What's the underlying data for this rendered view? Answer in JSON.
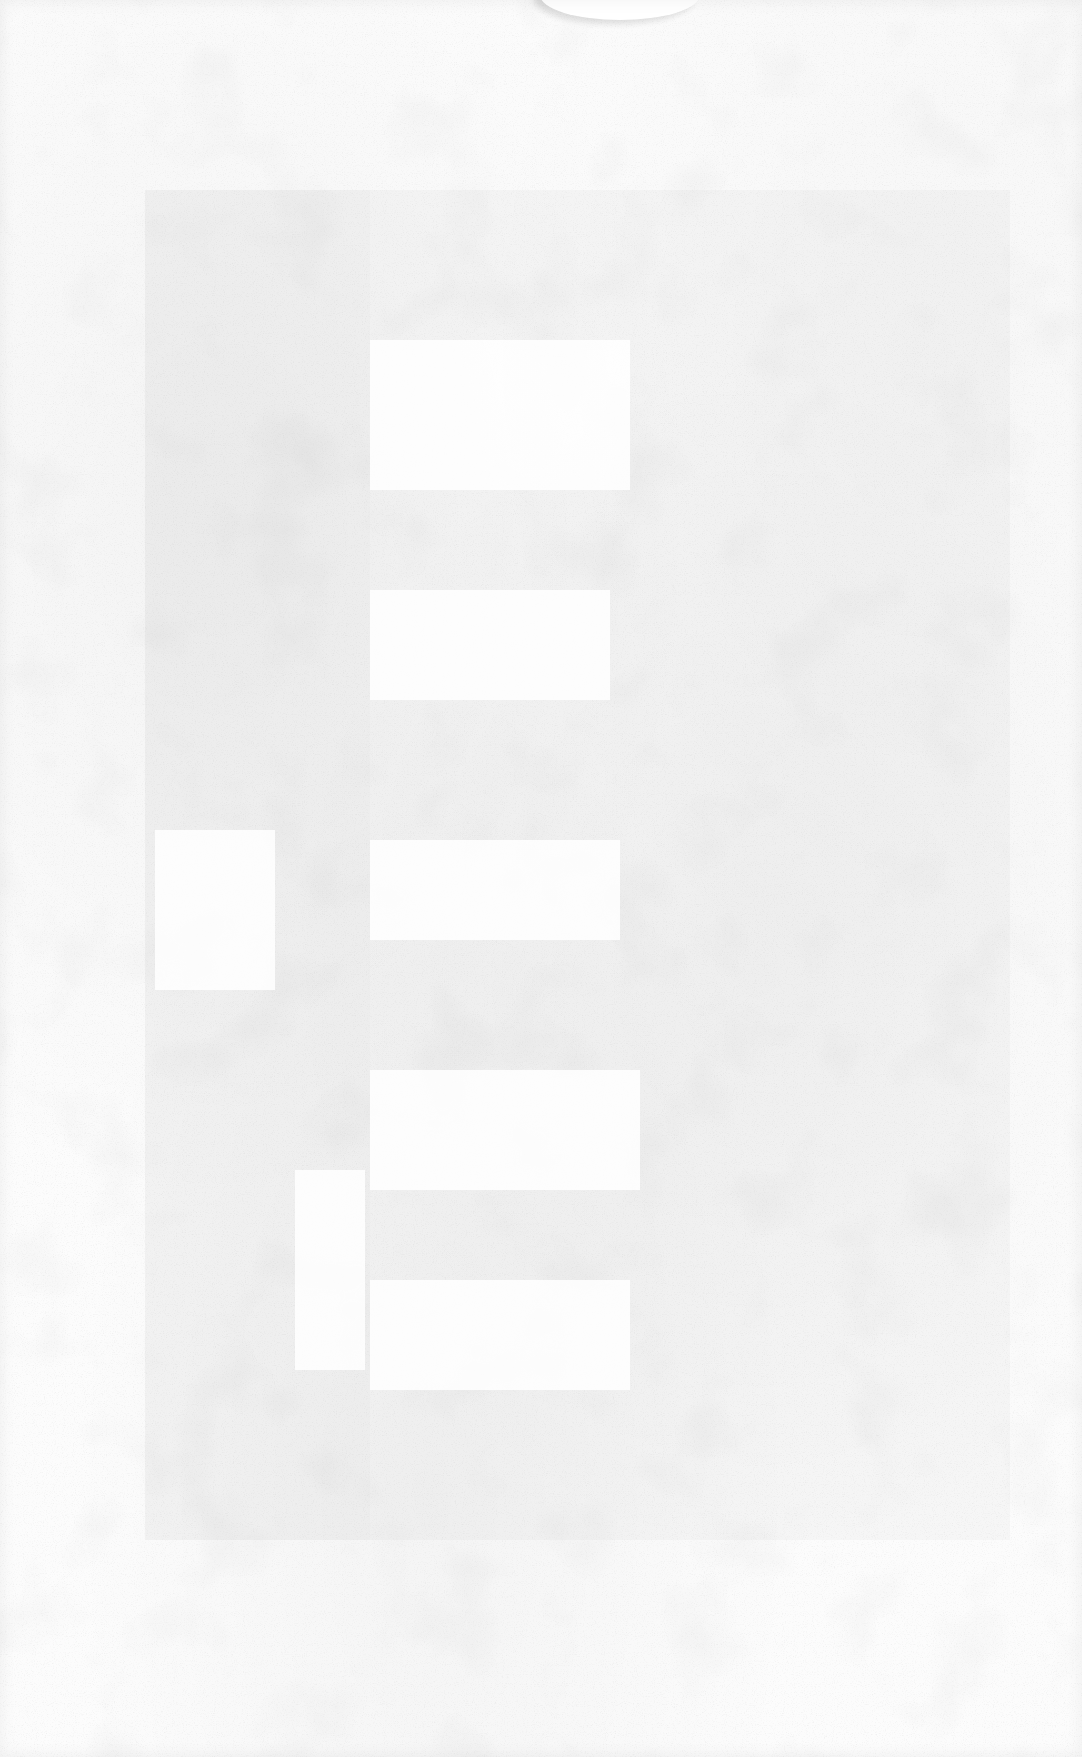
{
  "document": {
    "type": "blank-scanned-page",
    "visible_text": [],
    "colors": {
      "paper": "#fcfcfc",
      "speckle": "#c8c8c8"
    }
  }
}
